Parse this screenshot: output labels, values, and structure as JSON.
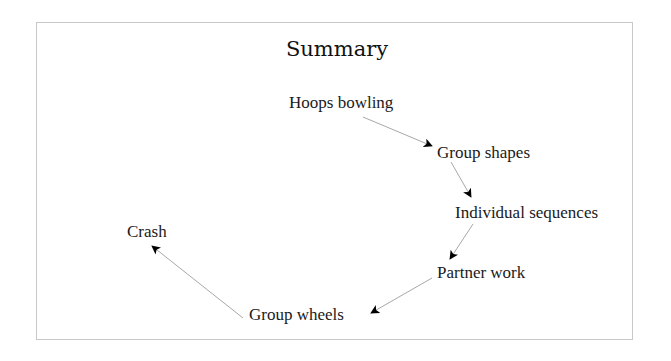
{
  "title": "Summary",
  "nodes": [
    {
      "id": "hoops-bowling",
      "label": "Hoops bowling"
    },
    {
      "id": "group-shapes",
      "label": "Group shapes"
    },
    {
      "id": "individual-sequences",
      "label": "Individual sequences"
    },
    {
      "id": "partner-work",
      "label": "Partner work"
    },
    {
      "id": "group-wheels",
      "label": "Group wheels"
    },
    {
      "id": "crash",
      "label": "Crash"
    }
  ],
  "edges": [
    {
      "from": "Hoops bowling",
      "to": "Group shapes"
    },
    {
      "from": "Group shapes",
      "to": "Individual sequences"
    },
    {
      "from": "Individual sequences",
      "to": "Partner work"
    },
    {
      "from": "Partner work",
      "to": "Group wheels"
    },
    {
      "from": "Group wheels",
      "to": "Crash"
    }
  ],
  "colors": {
    "border": "#c8c8c8",
    "edge": "#a8a8a8",
    "arrowhead": "#000000",
    "text": "#1a1a1a"
  }
}
